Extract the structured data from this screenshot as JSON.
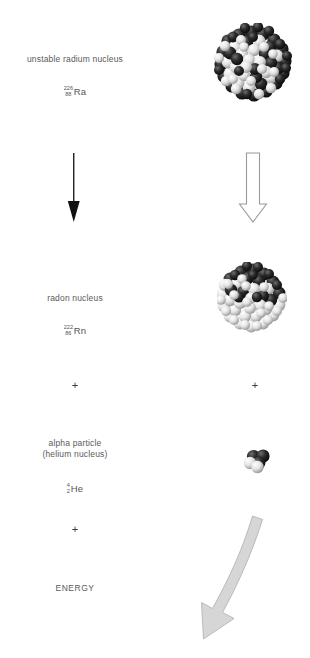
{
  "diagram": {
    "title_text": "",
    "colors": {
      "text": "#5a5a5a",
      "nucleon_dark": "#1a1a1a",
      "nucleon_light": "#f2f2f2",
      "black_arrow": "#111111",
      "open_arrow_stroke": "#9a9a9a",
      "energy_arrow_fill": "#d6d6d6",
      "energy_arrow_stroke": "#b0b0b0",
      "background": "#ffffff"
    },
    "rows": [
      {
        "id": "radium",
        "label": "unstable radium nucleus",
        "isotope": {
          "mass_number": "226",
          "atomic_number": "88",
          "symbol": "Ra"
        },
        "particle_name": "radium-226 nucleus",
        "nucleon_count_shown": 68
      },
      {
        "id": "radon",
        "label": "radon nucleus",
        "isotope": {
          "mass_number": "222",
          "atomic_number": "86",
          "symbol": "Rn"
        },
        "particle_name": "radon-222 nucleus",
        "nucleon_count_shown": 58
      },
      {
        "id": "alpha",
        "label_line1": "alpha particle",
        "label_line2": "(helium nucleus)",
        "isotope": {
          "mass_number": "4",
          "atomic_number": "2",
          "symbol": "He"
        },
        "particle_name": "alpha particle",
        "nucleon_count_shown": 4
      },
      {
        "id": "energy",
        "label": "ENERGY"
      }
    ],
    "operators": {
      "plus_1_left": "+",
      "plus_1_right": "+",
      "plus_2_left": "+"
    },
    "arrows": {
      "decay_left": {
        "name": "black-down-arrow",
        "direction": "down",
        "style": "solid-thin"
      },
      "decay_right": {
        "name": "open-block-down-arrow",
        "direction": "down",
        "style": "outline"
      },
      "energy_release": {
        "name": "energy-release-arrow",
        "direction": "down-left",
        "style": "filled-gray-tapered"
      }
    }
  }
}
